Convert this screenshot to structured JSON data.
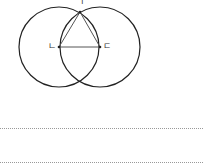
{
  "diagram": {
    "labels": {
      "top": "ㄱ",
      "left": "ㄴ",
      "right": "ㄷ"
    },
    "colors": {
      "circle": "#222222",
      "triangle": "#555555",
      "answer_line": "#999999"
    }
  },
  "answer_lines": [
    {
      "y": 128
    },
    {
      "y": 162
    }
  ]
}
